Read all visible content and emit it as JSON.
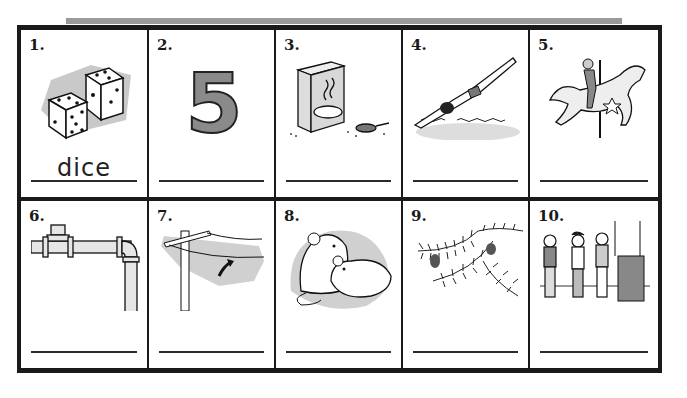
{
  "worksheet": {
    "items": [
      {
        "number": "1.",
        "picture": "dice",
        "answer": "dice"
      },
      {
        "number": "2.",
        "picture": "number-five",
        "answer": ""
      },
      {
        "number": "3.",
        "picture": "cereal-box-and-pot",
        "answer": ""
      },
      {
        "number": "4.",
        "picture": "diver",
        "answer": ""
      },
      {
        "number": "5.",
        "picture": "carousel-horse-rider",
        "answer": ""
      },
      {
        "number": "6.",
        "picture": "pipe",
        "answer": ""
      },
      {
        "number": "7.",
        "picture": "utility-pole-wire",
        "answer": ""
      },
      {
        "number": "8.",
        "picture": "mice",
        "answer": ""
      },
      {
        "number": "9.",
        "picture": "pine-branch-cones",
        "answer": ""
      },
      {
        "number": "10.",
        "picture": "children-in-line",
        "answer": ""
      }
    ],
    "digit_shown": "5"
  }
}
